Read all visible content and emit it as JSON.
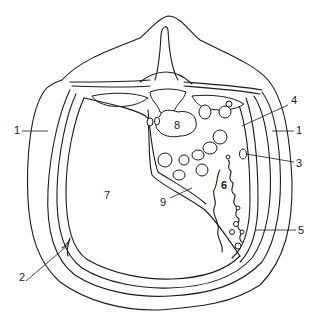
{
  "diagram": {
    "type": "anatomical-cross-section",
    "style": "black line drawing on white",
    "labels": [
      {
        "id": "1",
        "text": "1",
        "side": "left",
        "x": 14,
        "y": 131
      },
      {
        "id": "1b",
        "text": "1",
        "side": "right",
        "x": 296,
        "y": 131
      },
      {
        "id": "2",
        "text": "2",
        "x": 19,
        "y": 278
      },
      {
        "id": "3",
        "text": "3",
        "x": 296,
        "y": 158
      },
      {
        "id": "4",
        "text": "4",
        "x": 291,
        "y": 101
      },
      {
        "id": "5",
        "text": "5",
        "x": 298,
        "y": 231
      },
      {
        "id": "6",
        "text": "6",
        "x": 222,
        "y": 184
      },
      {
        "id": "7",
        "text": "7",
        "x": 104,
        "y": 196
      },
      {
        "id": "8",
        "text": "8",
        "x": 174,
        "y": 126
      },
      {
        "id": "9",
        "text": "9",
        "x": 163,
        "y": 201
      }
    ],
    "colors": {
      "line": "#1a1a1a",
      "background": "#ffffff"
    }
  }
}
